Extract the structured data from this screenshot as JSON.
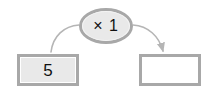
{
  "diagram": {
    "type": "function-machine",
    "background_color": "#ffffff",
    "input_node": {
      "value": "5",
      "fill_color": "#e9e9e9",
      "border_color": "#a8a8a8",
      "text_color": "#111111"
    },
    "operation_node": {
      "label": "× 1",
      "operator_symbol": "×",
      "operand": "1",
      "fill_color": "#e9e9e9",
      "border_color": "#a8a8a8",
      "text_color": "#111111"
    },
    "output_node": {
      "value": "",
      "fill_color": "#ffffff",
      "border_color": "#a8a8a8",
      "text_color": "#111111"
    },
    "connectors": [
      {
        "name": "input-to-operation",
        "from": "input_node",
        "to": "operation_node",
        "style": "curved",
        "arrowhead": false,
        "color": "#b5b5b5"
      },
      {
        "name": "operation-to-output",
        "from": "operation_node",
        "to": "output_node",
        "style": "curved",
        "arrowhead": true,
        "color": "#b5b5b5"
      }
    ]
  }
}
